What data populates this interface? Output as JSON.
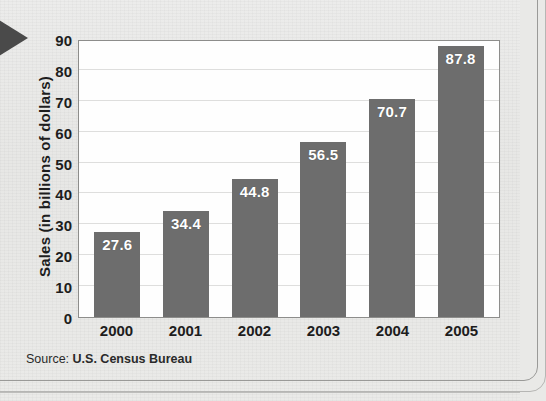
{
  "chart_data": {
    "type": "bar",
    "title": "",
    "xlabel": "",
    "ylabel": "Sales (in billions of dollars)",
    "categories": [
      "2000",
      "2001",
      "2002",
      "2003",
      "2004",
      "2005"
    ],
    "values": [
      27.6,
      34.4,
      44.8,
      56.5,
      70.7,
      87.8
    ],
    "value_labels": [
      "27.6",
      "34.4",
      "44.8",
      "56.5",
      "70.7",
      "87.8"
    ],
    "ylim": [
      0,
      90
    ],
    "ytick_step": 10,
    "yticks": [
      "90",
      "80",
      "70",
      "60",
      "50",
      "40",
      "30",
      "20",
      "10",
      "0"
    ],
    "grid": true,
    "grid_axis": "y",
    "legend": "none",
    "bar_color": "#6d6d6d",
    "value_label_color": "#ffffff",
    "plot_background": "#fefefe",
    "page_background": "#e9e9e7"
  },
  "source": {
    "label": "Source:",
    "value": "U.S. Census Bureau"
  },
  "marker": {
    "arrow_icon": "triangle-right-icon",
    "color": "#4a4a4a"
  }
}
